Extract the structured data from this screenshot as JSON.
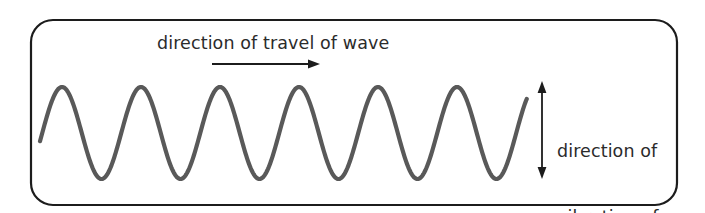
{
  "figure": {
    "name": "transverse-wave-diagram",
    "frame": {
      "shape": "rounded-rectangle",
      "x": 31,
      "y": 20,
      "width": 646,
      "height": 185,
      "corner_radius": 22,
      "stroke_color": "#1c1c1c",
      "stroke_width": 2.2,
      "fill_color": "#ffffff"
    },
    "wave": {
      "label": "transverse-waveform",
      "stroke_color": "#595959",
      "stroke_width": 4.2,
      "cycles": 6,
      "wavelength_px": 79,
      "amplitude_px": 46,
      "centerline_y": 133,
      "peak_y": 87,
      "trough_y": 180,
      "start_x": 40,
      "end_x": 527,
      "start_y": 133,
      "end_y": 135,
      "peaks_x": [
        62,
        141,
        220,
        299,
        378,
        457
      ],
      "troughs_x": [
        102,
        181,
        260,
        339,
        418,
        497
      ]
    },
    "travel_arrow": {
      "name": "direction-of-travel-arrow",
      "orientation": "horizontal",
      "direction": "right",
      "x1": 212,
      "x2": 318,
      "y": 64,
      "stroke_color": "#1c1c1c",
      "stroke_width": 1.8,
      "heads": "single"
    },
    "vibration_arrow": {
      "name": "direction-of-vibration-arrow",
      "orientation": "vertical",
      "direction": "both",
      "x": 542,
      "y1": 82,
      "y2": 178,
      "stroke_color": "#1c1c1c",
      "stroke_width": 1.8,
      "heads": "double"
    },
    "labels": {
      "travel": "direction of travel of wave",
      "vibration_lines": [
        "direction of",
        "vibration of",
        "particles"
      ],
      "text_color": "#2b2b2b"
    }
  }
}
